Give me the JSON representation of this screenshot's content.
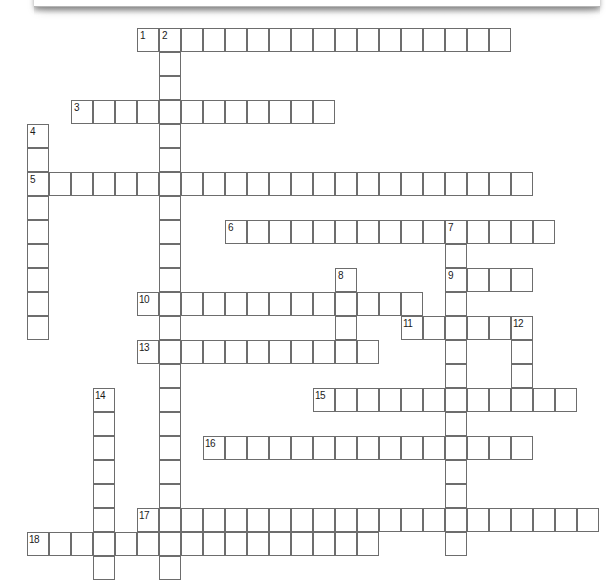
{
  "document": {
    "type": "crossword-puzzle-grid",
    "title": "",
    "page_edge_shadow": true,
    "background_color": "#ffffff",
    "cell_border_color": "#6d6d6d",
    "cell_fill_color": "#ffffff",
    "number_color": "#1b1b1b"
  },
  "grid": {
    "cell_width": 22,
    "cell_height": 24,
    "origin_x": 27,
    "origin_y": 28,
    "columns": 26,
    "rows": 23,
    "note": "Cells positioned by column/row index from origin."
  },
  "entries": [
    {
      "number": "1",
      "direction": "across",
      "col": 5,
      "row": 0,
      "length": 17
    },
    {
      "number": "2",
      "direction": "down",
      "col": 6,
      "row": 0,
      "length": 23
    },
    {
      "number": "3",
      "direction": "across",
      "col": 2,
      "row": 3,
      "length": 12
    },
    {
      "number": "4",
      "direction": "down",
      "col": 0,
      "row": 4,
      "length": 9
    },
    {
      "number": "5",
      "direction": "across",
      "col": 0,
      "row": 6,
      "length": 23
    },
    {
      "number": "6",
      "direction": "across",
      "col": 9,
      "row": 8,
      "length": 15
    },
    {
      "number": "7",
      "direction": "down",
      "col": 19,
      "row": 8,
      "length": 14
    },
    {
      "number": "8",
      "direction": "down",
      "col": 14,
      "row": 10,
      "length": 4
    },
    {
      "number": "9",
      "direction": "across",
      "col": 19,
      "row": 10,
      "length": 4
    },
    {
      "number": "10",
      "direction": "across",
      "col": 5,
      "row": 11,
      "length": 13
    },
    {
      "number": "11",
      "direction": "across",
      "col": 17,
      "row": 12,
      "length": 6
    },
    {
      "number": "12",
      "direction": "down",
      "col": 22,
      "row": 12,
      "length": 3
    },
    {
      "number": "13",
      "direction": "across",
      "col": 5,
      "row": 13,
      "length": 11
    },
    {
      "number": "14",
      "direction": "down",
      "col": 3,
      "row": 15,
      "length": 8
    },
    {
      "number": "15",
      "direction": "across",
      "col": 13,
      "row": 15,
      "length": 12
    },
    {
      "number": "16",
      "direction": "across",
      "col": 8,
      "row": 17,
      "length": 15
    },
    {
      "number": "17",
      "direction": "across",
      "col": 5,
      "row": 20,
      "length": 21
    },
    {
      "number": "18",
      "direction": "across",
      "col": 0,
      "row": 21,
      "length": 16
    }
  ],
  "numbers": [
    {
      "label": "1",
      "col": 5,
      "row": 0
    },
    {
      "label": "2",
      "col": 6,
      "row": 0
    },
    {
      "label": "3",
      "col": 2,
      "row": 3
    },
    {
      "label": "4",
      "col": 0,
      "row": 4
    },
    {
      "label": "5",
      "col": 0,
      "row": 6
    },
    {
      "label": "6",
      "col": 9,
      "row": 8
    },
    {
      "label": "7",
      "col": 19,
      "row": 8
    },
    {
      "label": "8",
      "col": 14,
      "row": 10
    },
    {
      "label": "9",
      "col": 19,
      "row": 10
    },
    {
      "label": "10",
      "col": 5,
      "row": 11
    },
    {
      "label": "11",
      "col": 17,
      "row": 12
    },
    {
      "label": "12",
      "col": 22,
      "row": 12
    },
    {
      "label": "13",
      "col": 5,
      "row": 13
    },
    {
      "label": "14",
      "col": 3,
      "row": 15
    },
    {
      "label": "15",
      "col": 13,
      "row": 15
    },
    {
      "label": "16",
      "col": 8,
      "row": 17
    },
    {
      "label": "17",
      "col": 5,
      "row": 20
    },
    {
      "label": "18",
      "col": 0,
      "row": 21
    }
  ],
  "letters": []
}
